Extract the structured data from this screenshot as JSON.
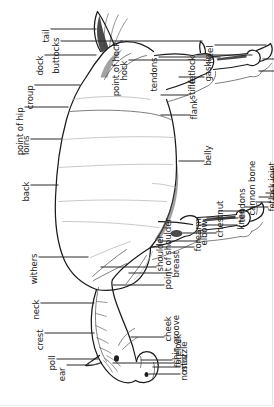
{
  "figure": {
    "orientation": "rotated-90-ccw",
    "line_color": "#1a1a1a",
    "text_color": "#1d1d1d",
    "background": "#ffffff"
  },
  "labels": {
    "point_of_hip": "point of hip",
    "croup": "croup",
    "dock": "dock",
    "tail": "tail",
    "buttocks": "buttocks",
    "point_of_hock": "point of hock",
    "hock": "hock",
    "tendons_hind": "tendons",
    "fetlock": "fetlock",
    "heel_hind": "heel",
    "loins": "loins",
    "back": "back",
    "withers": "withers",
    "neck": "neck",
    "crest": "crest",
    "poll": "poll",
    "ear": "ear",
    "forelock": "forelock",
    "nostril": "nostril",
    "muzzle": "muzzle",
    "cheek": "cheek",
    "chin_groove": "chin groove",
    "shoulder": "shoulder",
    "point_of_shoulder": "point of shoulder",
    "breast": "breast",
    "forearm": "forearm",
    "knee": "knee",
    "elbow": "elbow",
    "belly": "belly",
    "flank": "flank",
    "stifle": "stifle",
    "gaskin": "gaskin",
    "chestnut": "chestnut",
    "tendons_fore": "tendons",
    "cannon_bone": "cannon bone",
    "fetlock_joint": "fetlock joint",
    "pasterns": "pasterns",
    "coronet_fore": "coronet",
    "hoof": "hoof",
    "heel_fore": "heel",
    "pastern": "pastern",
    "coronet_hind": "coronet"
  }
}
